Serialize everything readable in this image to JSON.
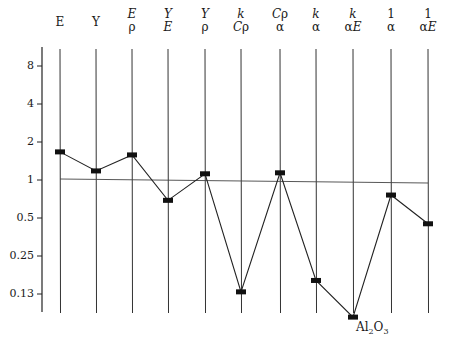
{
  "chart_data": {
    "type": "line",
    "title": "",
    "subtitle": "",
    "xlabel": "",
    "ylabel": "",
    "yscale": "log2",
    "ylim": [
      0.1,
      12
    ],
    "yticks": [
      8,
      4,
      2,
      1,
      0.5,
      0.25,
      0.13
    ],
    "ytick_labels": [
      "8",
      "4",
      "2",
      "1",
      "0.5",
      "0.25",
      "0.13"
    ],
    "grid": "vertical lines at each category",
    "reference_line": {
      "y": 1,
      "style": "thin horizontal"
    },
    "categories": [
      "E",
      "Y",
      "E/ρ",
      "Y/E",
      "Y/ρ",
      "k/Cρ",
      "Cρ/α",
      "k/α",
      "k/αE",
      "1/α",
      "1/αE"
    ],
    "series": [
      {
        "name": "Al2O3",
        "marker": "filled rectangle",
        "values": [
          1.67,
          1.18,
          1.58,
          0.69,
          1.12,
          0.13,
          1.14,
          0.16,
          0.082,
          0.76,
          0.45
        ]
      }
    ],
    "annotations": [
      {
        "text": "Al2O3",
        "position": "below k/αE point"
      }
    ],
    "legend": "none"
  },
  "headers": [
    {
      "num": "E",
      "den": ""
    },
    {
      "num": "Y",
      "den": ""
    },
    {
      "num": "E",
      "den": "ρ"
    },
    {
      "num": "Y",
      "den": "E"
    },
    {
      "num": "Y",
      "den": "ρ"
    },
    {
      "num": "k",
      "den": "Cρ"
    },
    {
      "num": "Cρ",
      "den": "α"
    },
    {
      "num": "k",
      "den": "α"
    },
    {
      "num": "k",
      "den": "αE"
    },
    {
      "num": "1",
      "den": "α"
    },
    {
      "num": "1",
      "den": "αE"
    }
  ],
  "annotation_label": {
    "main": "Al",
    "sub1": "2",
    "mid": "O",
    "sub2": "3"
  }
}
